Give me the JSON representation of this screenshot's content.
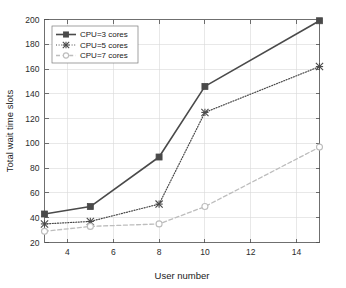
{
  "chart_data": {
    "type": "line",
    "title": "",
    "xlabel": "User number",
    "ylabel": "Total wait time slots",
    "x": [
      3,
      5,
      8,
      10,
      15
    ],
    "xlim": [
      3,
      15
    ],
    "ylim": [
      20,
      200
    ],
    "xticks": [
      4,
      6,
      8,
      10,
      12,
      14
    ],
    "yticks": [
      20,
      40,
      60,
      80,
      100,
      120,
      140,
      160,
      180,
      200
    ],
    "grid": true,
    "legend_position": "upper-left",
    "series": [
      {
        "name": "CPU=3 cores",
        "values": [
          43,
          49,
          89,
          146,
          199
        ],
        "color": "#4a4a4a",
        "linestyle": "solid",
        "marker": "square"
      },
      {
        "name": "CPU=5 cores",
        "values": [
          35,
          37,
          51,
          125,
          162
        ],
        "color": "#4a4a4a",
        "linestyle": "dotted",
        "marker": "asterisk"
      },
      {
        "name": "CPU=7 cores",
        "values": [
          29,
          33,
          35,
          49,
          97
        ],
        "color": "#bdbdbd",
        "linestyle": "dashed",
        "marker": "circle"
      }
    ]
  },
  "axes": {
    "ylabel": "Total wait time slots",
    "xlabel": "User number",
    "ytick_labels": [
      "20",
      "40",
      "60",
      "80",
      "100",
      "120",
      "140",
      "160",
      "180",
      "200"
    ],
    "xtick_labels": [
      "4",
      "6",
      "8",
      "10",
      "12",
      "14"
    ]
  },
  "legend": {
    "entries": [
      "CPU=3 cores",
      "CPU=5 cores",
      "CPU=7 cores"
    ]
  }
}
